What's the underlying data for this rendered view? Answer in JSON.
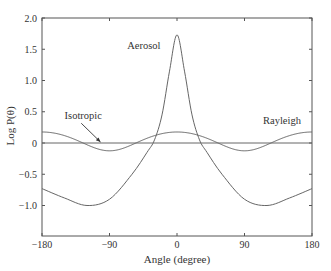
{
  "chart_data": {
    "type": "line",
    "title": "",
    "xlabel": "Angle (degree)",
    "ylabel": "Log P(θ)",
    "xlim": [
      -180,
      180
    ],
    "ylim": [
      -1.5,
      2.0
    ],
    "xticks": [
      "-180",
      "-90",
      "0",
      "90",
      "180"
    ],
    "yticks": [
      "2.0",
      "1.5",
      "1.0",
      "0.5",
      "0",
      "-0.5",
      "-1.0"
    ],
    "grid": false,
    "legend": "inline annotations",
    "series": [
      {
        "name": "Aerosol",
        "x": [
          -180,
          -150,
          -120,
          -90,
          -60,
          -40,
          -30,
          -20,
          -10,
          0,
          10,
          20,
          30,
          40,
          60,
          90,
          120,
          150,
          180
        ],
        "values": [
          -0.73,
          -0.88,
          -1.0,
          -0.9,
          -0.5,
          -0.15,
          0.05,
          0.45,
          1.15,
          1.73,
          1.15,
          0.45,
          0.05,
          -0.15,
          -0.5,
          -0.9,
          -1.0,
          -0.88,
          -0.73
        ]
      },
      {
        "name": "Rayleigh",
        "x": [
          -180,
          -135,
          -90,
          -45,
          0,
          45,
          90,
          135,
          180
        ],
        "values": [
          0.176,
          0.051,
          -0.125,
          0.051,
          0.176,
          0.051,
          -0.125,
          0.051,
          0.176
        ]
      },
      {
        "name": "Isotropic",
        "x": [
          -180,
          180
        ],
        "values": [
          0,
          0
        ]
      }
    ],
    "annotations": [
      {
        "text": "Aerosol",
        "x": -22,
        "y": 1.5
      },
      {
        "text": "Isotropic",
        "x": -125,
        "y": 0.38,
        "arrow_to": [
          -102,
          0.0
        ]
      },
      {
        "text": "Rayleigh",
        "x": 140,
        "y": 0.3
      }
    ]
  }
}
